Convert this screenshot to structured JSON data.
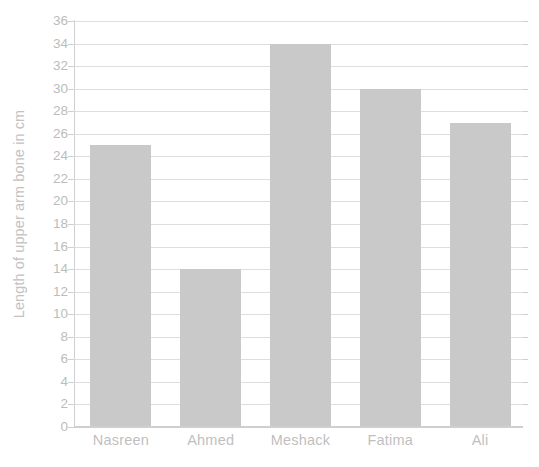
{
  "chart_data": {
    "type": "bar",
    "title": "",
    "xlabel": "",
    "ylabel": "Length of upper arm bone in cm",
    "categories": [
      "Nasreen",
      "Ahmed",
      "Meshack",
      "Fatima",
      "Ali"
    ],
    "values": [
      25,
      14,
      34,
      30,
      27
    ],
    "ylim": [
      0,
      36
    ],
    "ytick_step": 2,
    "yticks": [
      0,
      2,
      4,
      6,
      8,
      10,
      12,
      14,
      16,
      18,
      20,
      22,
      24,
      26,
      28,
      30,
      32,
      34,
      36
    ],
    "ytick_labels": [
      "0",
      "2",
      "4",
      "6",
      "8",
      "10",
      "12",
      "14",
      "16",
      "18",
      "20",
      "22",
      "24",
      "26",
      "28",
      "30",
      "32",
      "34",
      "36"
    ],
    "grid": true,
    "grid_axis": "y",
    "legend": false,
    "legend_position": "none",
    "orientation": "vertical",
    "bar_color": "#c9c9c9",
    "gridline_color": "#dedede",
    "axis_color": "#cfcfcf",
    "text_color": "#bfbfbf",
    "background_color": "#ffffff"
  }
}
